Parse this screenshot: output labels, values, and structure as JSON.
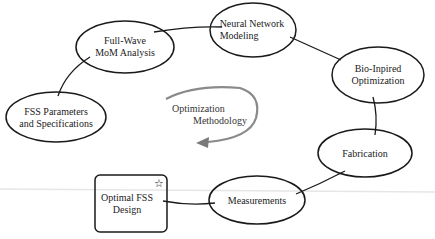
{
  "diagram": {
    "nodes": [
      {
        "id": "fss-params",
        "shape": "ellipse",
        "line1": "FSS Parameters",
        "line2": "and Specifications"
      },
      {
        "id": "full-wave",
        "shape": "ellipse",
        "line1": "Full-Wave",
        "line2": "MoM Analysis"
      },
      {
        "id": "neural-network",
        "shape": "ellipse",
        "line1": "Neural Network",
        "line2": "Modeling"
      },
      {
        "id": "bio-inspired",
        "shape": "ellipse",
        "line1": "Bio-Inpired",
        "line2": "Optimization"
      },
      {
        "id": "fabrication",
        "shape": "ellipse",
        "line1": "Fabrication",
        "line2": ""
      },
      {
        "id": "measurements",
        "shape": "ellipse",
        "line1": "Measurements",
        "line2": ""
      },
      {
        "id": "optimal-design",
        "shape": "rounded-rect",
        "line1": "Optimal FSS",
        "line2": "Design",
        "badge": "☆"
      }
    ],
    "center": {
      "line1": "Optimization",
      "line2": "Methodology"
    },
    "edges": [
      [
        "fss-params",
        "full-wave"
      ],
      [
        "full-wave",
        "neural-network"
      ],
      [
        "neural-network",
        "bio-inspired"
      ],
      [
        "bio-inspired",
        "fabrication"
      ],
      [
        "fabrication",
        "measurements"
      ],
      [
        "measurements",
        "optimal-design"
      ]
    ],
    "colors": {
      "stroke": "#1a1a1a",
      "center_arrow": "#888888",
      "text": "#222222"
    }
  }
}
